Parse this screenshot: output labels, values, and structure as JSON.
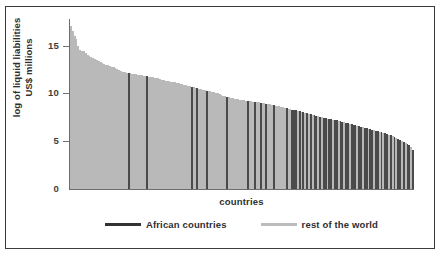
{
  "chart_data": {
    "type": "bar",
    "title": "",
    "xlabel": "countries",
    "ylabel": "log of liquid liabilities\nUS$ millions",
    "ylim": [
      0,
      17
    ],
    "yticks": [
      0,
      5,
      10,
      15
    ],
    "ytick_labels": [
      "0",
      "5",
      "10",
      "15"
    ],
    "xticks": [],
    "grid": false,
    "legend_position": "below",
    "series": [
      {
        "name": "African countries",
        "color": "#4a4a4a"
      },
      {
        "name": "rest of the world",
        "color": "#b9b9b9"
      }
    ],
    "note": "Countries sorted in descending order of log liquid liabilities; each bar is one country, shaded dark if African.",
    "bars": [
      {
        "v": 16.6,
        "g": "row"
      },
      {
        "v": 16.1,
        "g": "row"
      },
      {
        "v": 15.6,
        "g": "row"
      },
      {
        "v": 15.3,
        "g": "row"
      },
      {
        "v": 14.6,
        "g": "row"
      },
      {
        "v": 14.2,
        "g": "row"
      },
      {
        "v": 14.1,
        "g": "row"
      },
      {
        "v": 14.05,
        "g": "row"
      },
      {
        "v": 13.8,
        "g": "row"
      },
      {
        "v": 13.6,
        "g": "row"
      },
      {
        "v": 13.5,
        "g": "row"
      },
      {
        "v": 13.4,
        "g": "row"
      },
      {
        "v": 13.3,
        "g": "row"
      },
      {
        "v": 13.2,
        "g": "row"
      },
      {
        "v": 13.1,
        "g": "row"
      },
      {
        "v": 13.0,
        "g": "row"
      },
      {
        "v": 12.9,
        "g": "row"
      },
      {
        "v": 12.8,
        "g": "row"
      },
      {
        "v": 12.7,
        "g": "row"
      },
      {
        "v": 12.65,
        "g": "row"
      },
      {
        "v": 12.6,
        "g": "row"
      },
      {
        "v": 12.5,
        "g": "row"
      },
      {
        "v": 12.45,
        "g": "row"
      },
      {
        "v": 12.4,
        "g": "row"
      },
      {
        "v": 12.3,
        "g": "row"
      },
      {
        "v": 12.2,
        "g": "row"
      },
      {
        "v": 12.1,
        "g": "row"
      },
      {
        "v": 12.0,
        "g": "row"
      },
      {
        "v": 11.95,
        "g": "row"
      },
      {
        "v": 11.9,
        "g": "row"
      },
      {
        "v": 11.85,
        "g": "row"
      },
      {
        "v": 11.8,
        "g": "afr"
      },
      {
        "v": 11.8,
        "g": "row"
      },
      {
        "v": 11.75,
        "g": "row"
      },
      {
        "v": 11.7,
        "g": "row"
      },
      {
        "v": 11.7,
        "g": "row"
      },
      {
        "v": 11.65,
        "g": "row"
      },
      {
        "v": 11.6,
        "g": "row"
      },
      {
        "v": 11.6,
        "g": "row"
      },
      {
        "v": 11.55,
        "g": "row"
      },
      {
        "v": 11.5,
        "g": "row"
      },
      {
        "v": 11.5,
        "g": "afr"
      },
      {
        "v": 11.45,
        "g": "row"
      },
      {
        "v": 11.4,
        "g": "row"
      },
      {
        "v": 11.4,
        "g": "row"
      },
      {
        "v": 11.35,
        "g": "row"
      },
      {
        "v": 11.3,
        "g": "row"
      },
      {
        "v": 11.3,
        "g": "row"
      },
      {
        "v": 11.2,
        "g": "row"
      },
      {
        "v": 11.1,
        "g": "row"
      },
      {
        "v": 11.1,
        "g": "row"
      },
      {
        "v": 11.0,
        "g": "row"
      },
      {
        "v": 11.0,
        "g": "row"
      },
      {
        "v": 10.95,
        "g": "row"
      },
      {
        "v": 10.9,
        "g": "row"
      },
      {
        "v": 10.9,
        "g": "row"
      },
      {
        "v": 10.85,
        "g": "row"
      },
      {
        "v": 10.8,
        "g": "row"
      },
      {
        "v": 10.75,
        "g": "row"
      },
      {
        "v": 10.7,
        "g": "row"
      },
      {
        "v": 10.65,
        "g": "row"
      },
      {
        "v": 10.6,
        "g": "row"
      },
      {
        "v": 10.55,
        "g": "row"
      },
      {
        "v": 10.5,
        "g": "row"
      },
      {
        "v": 10.45,
        "g": "row"
      },
      {
        "v": 10.4,
        "g": "afr"
      },
      {
        "v": 10.35,
        "g": "row"
      },
      {
        "v": 10.3,
        "g": "row"
      },
      {
        "v": 10.25,
        "g": "afr"
      },
      {
        "v": 10.2,
        "g": "row"
      },
      {
        "v": 10.15,
        "g": "row"
      },
      {
        "v": 10.1,
        "g": "row"
      },
      {
        "v": 10.05,
        "g": "row"
      },
      {
        "v": 10.0,
        "g": "afr"
      },
      {
        "v": 10.0,
        "g": "row"
      },
      {
        "v": 9.95,
        "g": "row"
      },
      {
        "v": 9.9,
        "g": "row"
      },
      {
        "v": 9.85,
        "g": "row"
      },
      {
        "v": 9.8,
        "g": "row"
      },
      {
        "v": 9.75,
        "g": "row"
      },
      {
        "v": 9.7,
        "g": "row"
      },
      {
        "v": 9.6,
        "g": "row"
      },
      {
        "v": 9.5,
        "g": "row"
      },
      {
        "v": 9.45,
        "g": "row"
      },
      {
        "v": 9.4,
        "g": "afr"
      },
      {
        "v": 9.35,
        "g": "row"
      },
      {
        "v": 9.3,
        "g": "row"
      },
      {
        "v": 9.25,
        "g": "row"
      },
      {
        "v": 9.2,
        "g": "row"
      },
      {
        "v": 9.2,
        "g": "row"
      },
      {
        "v": 9.15,
        "g": "row"
      },
      {
        "v": 9.1,
        "g": "row"
      },
      {
        "v": 9.1,
        "g": "row"
      },
      {
        "v": 9.05,
        "g": "row"
      },
      {
        "v": 9.0,
        "g": "row"
      },
      {
        "v": 9.0,
        "g": "afr"
      },
      {
        "v": 8.95,
        "g": "row"
      },
      {
        "v": 8.95,
        "g": "row"
      },
      {
        "v": 8.9,
        "g": "row"
      },
      {
        "v": 8.9,
        "g": "afr"
      },
      {
        "v": 8.85,
        "g": "row"
      },
      {
        "v": 8.85,
        "g": "row"
      },
      {
        "v": 8.8,
        "g": "afr"
      },
      {
        "v": 8.8,
        "g": "row"
      },
      {
        "v": 8.75,
        "g": "row"
      },
      {
        "v": 8.7,
        "g": "afr"
      },
      {
        "v": 8.7,
        "g": "row"
      },
      {
        "v": 8.65,
        "g": "row"
      },
      {
        "v": 8.6,
        "g": "row"
      },
      {
        "v": 8.55,
        "g": "afr"
      },
      {
        "v": 8.5,
        "g": "row"
      },
      {
        "v": 8.45,
        "g": "row"
      },
      {
        "v": 8.4,
        "g": "row"
      },
      {
        "v": 8.35,
        "g": "row"
      },
      {
        "v": 8.3,
        "g": "row"
      },
      {
        "v": 8.25,
        "g": "row"
      },
      {
        "v": 8.2,
        "g": "afr"
      },
      {
        "v": 8.15,
        "g": "row"
      },
      {
        "v": 8.1,
        "g": "row"
      },
      {
        "v": 8.05,
        "g": "afr"
      },
      {
        "v": 8.0,
        "g": "afr"
      },
      {
        "v": 8.0,
        "g": "afr"
      },
      {
        "v": 7.95,
        "g": "row"
      },
      {
        "v": 7.9,
        "g": "afr"
      },
      {
        "v": 7.85,
        "g": "row"
      },
      {
        "v": 7.8,
        "g": "afr"
      },
      {
        "v": 7.75,
        "g": "row"
      },
      {
        "v": 7.7,
        "g": "afr"
      },
      {
        "v": 7.65,
        "g": "row"
      },
      {
        "v": 7.6,
        "g": "afr"
      },
      {
        "v": 7.55,
        "g": "row"
      },
      {
        "v": 7.5,
        "g": "afr"
      },
      {
        "v": 7.45,
        "g": "afr"
      },
      {
        "v": 7.4,
        "g": "row"
      },
      {
        "v": 7.35,
        "g": "afr"
      },
      {
        "v": 7.3,
        "g": "row"
      },
      {
        "v": 7.25,
        "g": "afr"
      },
      {
        "v": 7.2,
        "g": "afr"
      },
      {
        "v": 7.15,
        "g": "row"
      },
      {
        "v": 7.1,
        "g": "afr"
      },
      {
        "v": 7.1,
        "g": "afr"
      },
      {
        "v": 7.05,
        "g": "row"
      },
      {
        "v": 7.0,
        "g": "afr"
      },
      {
        "v": 7.0,
        "g": "afr"
      },
      {
        "v": 6.95,
        "g": "row"
      },
      {
        "v": 6.9,
        "g": "afr"
      },
      {
        "v": 6.85,
        "g": "afr"
      },
      {
        "v": 6.8,
        "g": "row"
      },
      {
        "v": 6.75,
        "g": "afr"
      },
      {
        "v": 6.7,
        "g": "afr"
      },
      {
        "v": 6.65,
        "g": "row"
      },
      {
        "v": 6.6,
        "g": "afr"
      },
      {
        "v": 6.55,
        "g": "afr"
      },
      {
        "v": 6.5,
        "g": "afr"
      },
      {
        "v": 6.45,
        "g": "row"
      },
      {
        "v": 6.4,
        "g": "afr"
      },
      {
        "v": 6.35,
        "g": "afr"
      },
      {
        "v": 6.3,
        "g": "row"
      },
      {
        "v": 6.25,
        "g": "afr"
      },
      {
        "v": 6.2,
        "g": "afr"
      },
      {
        "v": 6.15,
        "g": "row"
      },
      {
        "v": 6.1,
        "g": "afr"
      },
      {
        "v": 6.05,
        "g": "afr"
      },
      {
        "v": 6.0,
        "g": "row"
      },
      {
        "v": 5.95,
        "g": "afr"
      },
      {
        "v": 5.9,
        "g": "afr"
      },
      {
        "v": 5.85,
        "g": "row"
      },
      {
        "v": 5.8,
        "g": "afr"
      },
      {
        "v": 5.75,
        "g": "row"
      },
      {
        "v": 5.7,
        "g": "afr"
      },
      {
        "v": 5.6,
        "g": "afr"
      },
      {
        "v": 5.5,
        "g": "row"
      },
      {
        "v": 5.45,
        "g": "afr"
      },
      {
        "v": 5.4,
        "g": "row"
      },
      {
        "v": 5.3,
        "g": "afr"
      },
      {
        "v": 5.2,
        "g": "row"
      },
      {
        "v": 5.1,
        "g": "afr"
      },
      {
        "v": 5.0,
        "g": "afr"
      },
      {
        "v": 4.9,
        "g": "row"
      },
      {
        "v": 4.8,
        "g": "afr"
      },
      {
        "v": 4.7,
        "g": "row"
      },
      {
        "v": 4.6,
        "g": "afr"
      },
      {
        "v": 4.5,
        "g": "afr"
      },
      {
        "v": 4.3,
        "g": "row"
      },
      {
        "v": 4.0,
        "g": "afr"
      }
    ]
  },
  "axis": {
    "y_title": "log of liquid liabilities\nUS$ millions",
    "y_title_line1": "log of liquid liabilities",
    "y_title_line2": "US$ millions",
    "x_title": "countries",
    "tick_15": "15",
    "tick_10": "10",
    "tick_5": "5",
    "tick_0": "0"
  },
  "legend": {
    "items": [
      {
        "label": "African countries",
        "color": "#4a4a4a"
      },
      {
        "label": "rest of the world",
        "color": "#b9b9b9"
      }
    ]
  }
}
